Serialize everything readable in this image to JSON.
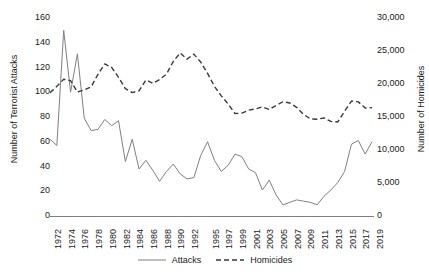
{
  "chart_data": {
    "type": "line",
    "title": "",
    "xlabel": "",
    "ylabel": "Number of Terrorist Attacks",
    "y2label": "Number of Homicides",
    "grid": false,
    "legend_position": "bottom-center",
    "xlim": [
      1972,
      2019
    ],
    "ylim": [
      0,
      160
    ],
    "y2lim": [
      0,
      30000
    ],
    "yticks": [
      "0",
      "20",
      "40",
      "60",
      "80",
      "100",
      "120",
      "140",
      "160"
    ],
    "ytick_values": [
      0,
      20,
      40,
      60,
      80,
      100,
      120,
      140,
      160
    ],
    "y2ticks": [
      "0",
      "5,000",
      "10,000",
      "15,000",
      "20,000",
      "25,000",
      "30,000"
    ],
    "y2tick_values": [
      0,
      5000,
      10000,
      15000,
      20000,
      25000,
      30000
    ],
    "xticks": [
      "1972",
      "1974",
      "1976",
      "1978",
      "1980",
      "1982",
      "1984",
      "1986",
      "1988",
      "1990",
      "1992",
      "1995",
      "1997",
      "1999",
      "2001",
      "2003",
      "2005",
      "2007",
      "2009",
      "2011",
      "2013",
      "2015",
      "2017",
      "2019"
    ],
    "x": [
      1972,
      1973,
      1974,
      1975,
      1976,
      1977,
      1978,
      1979,
      1980,
      1981,
      1982,
      1983,
      1984,
      1985,
      1986,
      1987,
      1988,
      1989,
      1990,
      1991,
      1992,
      1993,
      1994,
      1995,
      1996,
      1997,
      1998,
      1999,
      2000,
      2001,
      2002,
      2003,
      2004,
      2005,
      2006,
      2007,
      2008,
      2009,
      2010,
      2011,
      2012,
      2013,
      2014,
      2015,
      2016,
      2017,
      2018,
      2019
    ],
    "series": [
      {
        "name": "Attacks",
        "axis": "left",
        "style": "solid",
        "color": "#808080",
        "values": [
          62,
          57,
          150,
          100,
          131,
          79,
          69,
          70,
          78,
          73,
          77,
          44,
          62,
          38,
          45,
          37,
          28,
          36,
          42,
          34,
          30,
          31,
          49,
          60,
          45,
          36,
          41,
          50,
          48,
          38,
          35,
          21,
          29,
          17,
          9,
          11,
          13,
          12,
          11,
          9,
          16,
          21,
          27,
          36,
          58,
          61,
          50,
          60
        ]
      },
      {
        "name": "Homicides",
        "axis": "right",
        "style": "dashed",
        "color": "#3a3a3a",
        "values": [
          18670,
          19640,
          20710,
          20510,
          18780,
          19120,
          19560,
          21460,
          23040,
          22520,
          21010,
          19308,
          18692,
          18976,
          20613,
          20096,
          20675,
          21500,
          23438,
          24703,
          23760,
          24530,
          23326,
          21606,
          19645,
          18208,
          16974,
          15522,
          15586,
          16037,
          16229,
          16528,
          16148,
          16740,
          17309,
          17128,
          16465,
          15399,
          14722,
          14661,
          14856,
          14319,
          14249,
          15883,
          17413,
          17294,
          16374,
          16425
        ]
      }
    ]
  },
  "legend": {
    "items": [
      {
        "label": "Attacks",
        "style": "solid"
      },
      {
        "label": "Homicides",
        "style": "dashed"
      }
    ]
  }
}
